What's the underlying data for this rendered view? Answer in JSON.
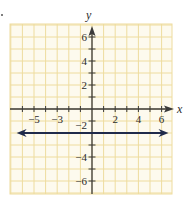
{
  "chart_data": {
    "type": "line",
    "title": "",
    "xlabel": "x",
    "ylabel": "y",
    "xlim": [
      -7,
      7
    ],
    "ylim": [
      -7,
      7
    ],
    "grid": true,
    "legend": null,
    "x_tick_labels": [
      "-5",
      "-3",
      "2",
      "4",
      "6"
    ],
    "y_tick_labels": [
      "6",
      "4",
      "2",
      "-2",
      "-4",
      "-6"
    ],
    "x_ticks": [
      -6,
      -5,
      -4,
      -3,
      -2,
      -1,
      1,
      2,
      3,
      4,
      5,
      6
    ],
    "y_ticks": [
      -6,
      -5,
      -4,
      -3,
      -2,
      -1,
      1,
      2,
      3,
      4,
      5,
      6
    ],
    "series": [
      {
        "name": "y = -2",
        "kind": "horizontal_line",
        "x": [
          -6.5,
          6.6
        ],
        "values": [
          -2,
          -2
        ],
        "arrows": "both",
        "color": "#1f2a4a"
      }
    ],
    "axes": {
      "x_arrow": "positive",
      "y_arrow": "positive"
    }
  },
  "labels": {
    "x_axis": "x",
    "y_axis": "y",
    "x_ticks": [
      {
        "value": -5,
        "text": "−5"
      },
      {
        "value": -3,
        "text": "−3"
      },
      {
        "value": 2,
        "text": "2"
      },
      {
        "value": 4,
        "text": "4"
      },
      {
        "value": 6,
        "text": "6"
      }
    ],
    "y_ticks": [
      {
        "value": 6,
        "text": "6"
      },
      {
        "value": 4,
        "text": "4"
      },
      {
        "value": 2,
        "text": "2"
      },
      {
        "value": -2,
        "text": "−2"
      },
      {
        "value": -4,
        "text": "−4"
      },
      {
        "value": -6,
        "text": "−6"
      }
    ]
  },
  "colors": {
    "grid_background": "#fdfaee",
    "grid_line": "#eedc9e",
    "axis": "#3a3a3a",
    "line": "#1f2a4a",
    "text": "#2b2b2b"
  }
}
